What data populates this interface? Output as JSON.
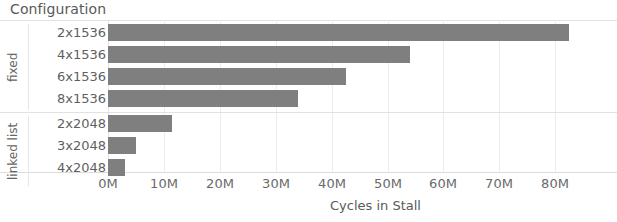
{
  "chart_data": {
    "type": "bar",
    "orientation": "horizontal",
    "title": "",
    "xlabel": "Cycles in Stall",
    "ylabel": "Configuration",
    "axis_header": "Configuration",
    "grid": true,
    "legend": "none",
    "xlim": [
      0,
      85
    ],
    "xunit": "M",
    "xticks": [
      0,
      10,
      20,
      30,
      40,
      50,
      60,
      70,
      80
    ],
    "xtick_labels": [
      "0M",
      "10M",
      "20M",
      "30M",
      "40M",
      "50M",
      "60M",
      "70M",
      "80M"
    ],
    "bar_color": "#7f7f7f",
    "grid_color": "#ededed",
    "groups": [
      {
        "name": "fixed",
        "categories": [
          "2x1536",
          "4x1536",
          "6x1536",
          "8x1536"
        ],
        "values": [
          82.5,
          54.0,
          42.5,
          34.0
        ]
      },
      {
        "name": "linked list",
        "categories": [
          "2x2048",
          "3x2048",
          "4x2048"
        ],
        "values": [
          11.5,
          5.0,
          3.0
        ]
      }
    ],
    "categories": [
      "2x1536",
      "4x1536",
      "6x1536",
      "8x1536",
      "2x2048",
      "3x2048",
      "4x2048"
    ],
    "values": [
      82.5,
      54.0,
      42.5,
      34.0,
      11.5,
      5.0,
      3.0
    ]
  }
}
